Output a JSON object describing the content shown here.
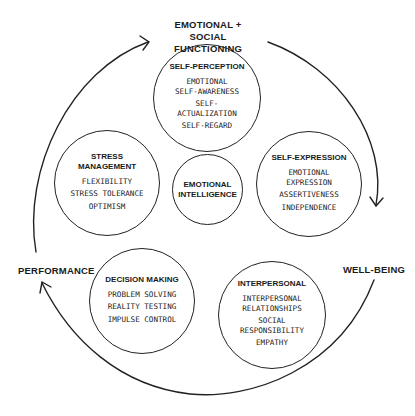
{
  "outer_labels": {
    "top": "EMOTIONAL +\nSOCIAL FUNCTIONING",
    "right": "WELL-BEING",
    "left": "PERFORMANCE"
  },
  "center": {
    "title": "EMOTIONAL\nINTELLIGENCE"
  },
  "composites": [
    {
      "id": "self-perception",
      "title": "SELF-PERCEPTION",
      "items": [
        "EMOTIONAL\nSELF-AWARENESS",
        "SELF-\nACTUALIZATION",
        "SELF-REGARD"
      ]
    },
    {
      "id": "self-expression",
      "title": "SELF-EXPRESSION",
      "items": [
        "EMOTIONAL\nEXPRESSION",
        "ASSERTIVENESS",
        "INDEPENDENCE"
      ]
    },
    {
      "id": "interpersonal",
      "title": "INTERPERSONAL",
      "items": [
        "INTERPERSONAL\nRELATIONSHIPS",
        "SOCIAL\nRESPONSIBILITY",
        "EMPATHY"
      ]
    },
    {
      "id": "decision-making",
      "title": "DECISION MAKING",
      "items": [
        "PROBLEM SOLVING",
        "REALITY TESTING",
        "IMPULSE CONTROL"
      ]
    },
    {
      "id": "stress-management",
      "title": "STRESS\nMANAGEMENT",
      "items": [
        "FLEXIBILITY",
        "STRESS TOLERANCE",
        "OPTIMISM"
      ]
    }
  ],
  "colors": {
    "stroke": "#222222",
    "text": "#1a1a1a",
    "background": "#ffffff"
  }
}
